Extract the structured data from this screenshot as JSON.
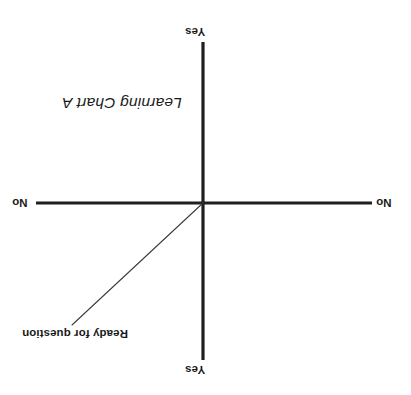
{
  "chart_data": {
    "type": "line",
    "title": "Learning Chart A",
    "xlabel": "",
    "ylabel": "",
    "orientation": "rotated-180",
    "grid": false,
    "legend": "none",
    "background": "#ffffff",
    "axis_color": "#1f1f1f",
    "series_color": "#3a3a3a",
    "axes": {
      "vertical": {
        "top_tick_label": "Yes",
        "bottom_tick_label": "Yes",
        "x": 203,
        "y_start": 42,
        "y_end": 360
      },
      "horizontal": {
        "left_tick_label": "No",
        "right_tick_label": "No",
        "y": 203,
        "x_start": 36,
        "x_end": 372
      },
      "origin": {
        "x": 203,
        "y": 203
      }
    },
    "series": [
      {
        "name": "Ready for question",
        "label": "Ready for question",
        "points": [
          {
            "x": 203,
            "y": 203
          },
          {
            "x": 72,
            "y": 325
          }
        ]
      }
    ]
  },
  "labels": {
    "yes_top": "Yes",
    "yes_bottom": "Yes",
    "no_left": "No",
    "no_right": "No",
    "title": "Learning Chart A",
    "series_label": "Ready for question"
  }
}
